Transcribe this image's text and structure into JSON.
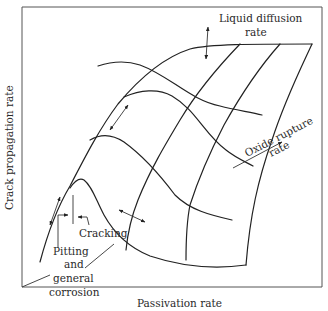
{
  "figure": {
    "type": "3d-surface-schematic",
    "axes": {
      "x_label": "Passivation rate",
      "y_label": "Crack propagation rate",
      "depth_labels": {
        "liquid_diffusion": [
          "Liquid diffusion",
          "rate"
        ],
        "oxide_rupture": [
          "Oxide rupture",
          "rate"
        ]
      }
    },
    "regions": {
      "cracking": "Cracking",
      "pitting": [
        "Pitting",
        "and",
        "general",
        "corrosion"
      ]
    },
    "colors": {
      "line": "#222222",
      "text": "#2a2a2a",
      "background": "#ffffff",
      "frame": "#555555"
    }
  }
}
